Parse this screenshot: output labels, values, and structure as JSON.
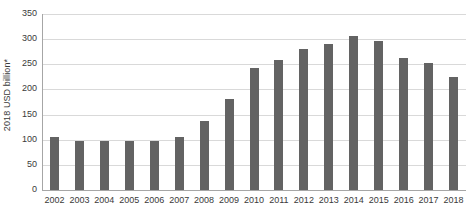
{
  "chart_data": {
    "type": "bar",
    "title": "",
    "subtitle": "",
    "xlabel": "",
    "ylabel": "2018 USD billion*",
    "categories": [
      "2002",
      "2003",
      "2004",
      "2005",
      "2006",
      "2007",
      "2008",
      "2009",
      "2010",
      "2011",
      "2012",
      "2013",
      "2014",
      "2015",
      "2016",
      "2017",
      "2018"
    ],
    "values": [
      105,
      97,
      97,
      97,
      98,
      106,
      138,
      181,
      242,
      259,
      280,
      291,
      306,
      296,
      262,
      252,
      224
    ],
    "series": [
      {
        "name": "2018 USD billion*",
        "values": [
          105,
          97,
          97,
          97,
          98,
          106,
          138,
          181,
          242,
          259,
          280,
          291,
          306,
          296,
          262,
          252,
          224
        ]
      }
    ],
    "ylim": [
      0,
      350
    ],
    "ytick_labels": [
      "0",
      "50",
      "100",
      "150",
      "200",
      "250",
      "300",
      "350"
    ],
    "ytick_values": [
      0,
      50,
      100,
      150,
      200,
      250,
      300,
      350
    ],
    "grid": true,
    "legend": false,
    "legend_position": "none",
    "bar_color": "#636363",
    "gridline_color": "#d9d9d9",
    "axis_color": "#a6a6a6",
    "text_color": "#3a3a3a",
    "annotations": []
  }
}
